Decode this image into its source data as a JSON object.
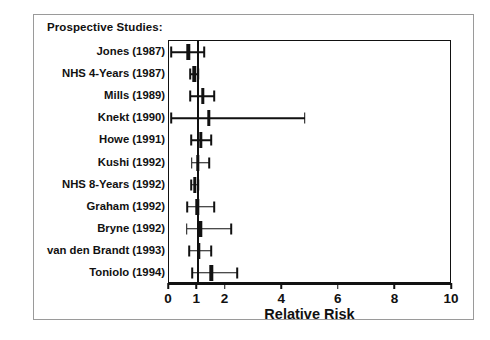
{
  "figure": {
    "section_heading": "Prospective Studies:",
    "x_axis_title": "Relative Risk"
  },
  "chart_data": {
    "type": "forest",
    "title": "Prospective Studies:",
    "xlabel": "Relative Risk",
    "ylabel": "",
    "xlim": [
      0,
      10
    ],
    "xticks": [
      0,
      1,
      2,
      4,
      6,
      8,
      10
    ],
    "xtick_labels": [
      "0",
      "1",
      "2",
      "4",
      "6",
      "8",
      "10"
    ],
    "null_line": 1,
    "grid": false,
    "legend": "none",
    "categories": [
      "Jones (1987)",
      "NHS 4-Years (1987)",
      "Mills (1989)",
      "Knekt (1990)",
      "Howe (1991)",
      "Kushi (1992)",
      "NHS 8-Years (1992)",
      "Graham (1992)",
      "Bryne (1992)",
      "van den Brandt (1993)",
      "Toniolo (1994)"
    ],
    "values": [
      0.68,
      0.9,
      1.2,
      1.4,
      1.12,
      1.02,
      0.92,
      1.0,
      1.1,
      1.05,
      1.5
    ],
    "ci_low": [
      0.07,
      0.75,
      0.75,
      0.07,
      0.78,
      0.8,
      0.78,
      0.65,
      0.62,
      0.72,
      0.82
    ],
    "ci_high": [
      1.25,
      1.05,
      1.6,
      4.8,
      1.5,
      1.42,
      1.05,
      1.6,
      2.2,
      1.5,
      2.4
    ],
    "points": [
      {
        "label": "Jones (1987)",
        "estimate": 0.68,
        "ci_low": 0.07,
        "ci_high": 1.25
      },
      {
        "label": "NHS 4-Years (1987)",
        "estimate": 0.9,
        "ci_low": 0.75,
        "ci_high": 1.05
      },
      {
        "label": "Mills (1989)",
        "estimate": 1.2,
        "ci_low": 0.75,
        "ci_high": 1.6
      },
      {
        "label": "Knekt (1990)",
        "estimate": 1.4,
        "ci_low": 0.07,
        "ci_high": 4.8
      },
      {
        "label": "Howe (1991)",
        "estimate": 1.12,
        "ci_low": 0.78,
        "ci_high": 1.5
      },
      {
        "label": "Kushi (1992)",
        "estimate": 1.02,
        "ci_low": 0.8,
        "ci_high": 1.42
      },
      {
        "label": "NHS 8-Years (1992)",
        "estimate": 0.92,
        "ci_low": 0.78,
        "ci_high": 1.05
      },
      {
        "label": "Graham (1992)",
        "estimate": 1.0,
        "ci_low": 0.65,
        "ci_high": 1.6
      },
      {
        "label": "Bryne (1992)",
        "estimate": 1.1,
        "ci_low": 0.62,
        "ci_high": 2.2
      },
      {
        "label": "van den Brandt (1993)",
        "estimate": 1.05,
        "ci_low": 0.72,
        "ci_high": 1.5
      },
      {
        "label": "Toniolo (1994)",
        "estimate": 1.5,
        "ci_low": 0.82,
        "ci_high": 2.4
      }
    ]
  },
  "colors": {
    "ink": "#111111",
    "page_border": "#9a9a9a",
    "background": "#ffffff"
  }
}
